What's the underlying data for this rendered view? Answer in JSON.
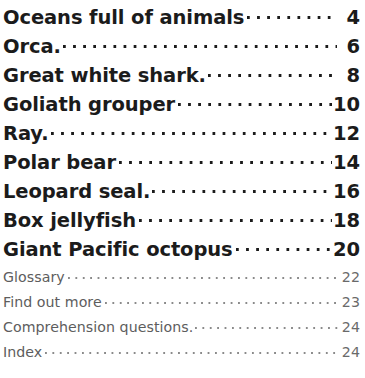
{
  "document": {
    "type": "table-of-contents",
    "background_color": "#ffffff",
    "primary_text_color": "#1b1b1b",
    "secondary_text_color": "#5d5d5d",
    "leader_style": "dotted"
  },
  "contents": {
    "main_entries": [
      {
        "title": "Oceans full of animals",
        "page": "4"
      },
      {
        "title": "Orca.",
        "page": "6"
      },
      {
        "title": "Great white shark.",
        "page": "8"
      },
      {
        "title": "Goliath grouper",
        "page": "10"
      },
      {
        "title": "Ray.",
        "page": "12"
      },
      {
        "title": "Polar bear",
        "page": "14"
      },
      {
        "title": "Leopard seal.",
        "page": "16"
      },
      {
        "title": "Box jellyfish",
        "page": "18"
      },
      {
        "title": "Giant Pacific octopus",
        "page": "20"
      }
    ],
    "back_matter_entries": [
      {
        "title": "Glossary",
        "page": "22"
      },
      {
        "title": "Find out more",
        "page": "23"
      },
      {
        "title": "Comprehension questions.",
        "page": "24"
      },
      {
        "title": "Index",
        "page": "24"
      }
    ]
  }
}
